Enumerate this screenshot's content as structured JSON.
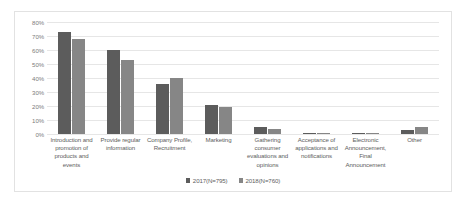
{
  "chart_data": {
    "type": "bar",
    "title": "",
    "xlabel": "",
    "ylabel": "",
    "ylim": [
      0,
      80
    ],
    "ytick_labels": [
      "80%",
      "70%",
      "60%",
      "50%",
      "40%",
      "30%",
      "20%",
      "10%",
      "0%"
    ],
    "ytick_values": [
      80,
      70,
      60,
      50,
      40,
      30,
      20,
      10,
      0
    ],
    "grid": true,
    "legend_position": "bottom",
    "categories": [
      "Introduction and promotion of products and events",
      "Provide regular information",
      "Company Profile, Recruitment",
      "Marketing",
      "Gathering consumer evaluations and opinions",
      "Acceptance of applications and notifications",
      "Electronic Announcement, Final Announcement",
      "Other"
    ],
    "series": [
      {
        "name": "2017(N=795)",
        "color": "#5c5c5c",
        "values": [
          73,
          60,
          36,
          21,
          5,
          1,
          0.5,
          3
        ]
      },
      {
        "name": "2018(N=760)",
        "color": "#868686",
        "values": [
          68,
          53,
          40,
          19,
          3.5,
          1,
          1,
          5
        ]
      }
    ]
  }
}
